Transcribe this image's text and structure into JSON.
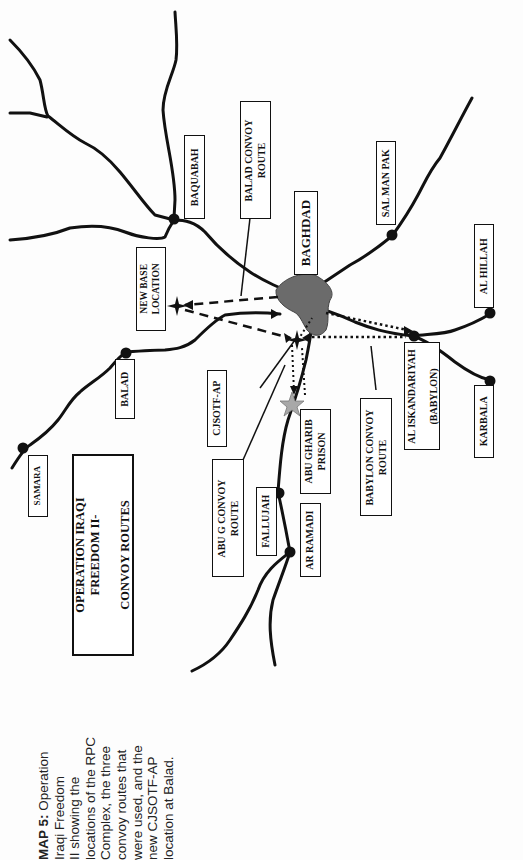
{
  "title_box": {
    "lines": "OPERATION IRAQI\nFREEDOM II-\n\nCONVOY ROUTES"
  },
  "caption": {
    "bold": "MAP 5:",
    "lines": [
      " Operation",
      "Iraqi Freedom",
      "II showing the",
      "locations of the RPC",
      "Complex, the three",
      "convoy routes that",
      "were used, and the",
      "new CJSOTF-AP",
      "location at Balad."
    ]
  },
  "places": {
    "baghdad": "BAGHDAD",
    "baquabah": "BAQUABAH",
    "balad": "BALAD",
    "samara": "SAMARA",
    "sal_man_pak": "SAL MAN PAK",
    "al_hillah": "AL HILLAH",
    "al_iskandariyah": "AL ISKANDARIYAH\n\n(BABYLON)",
    "karbala": "KARBALA",
    "fallujah": "FALLUJAH",
    "ar_ramadi": "AR RAMADI",
    "abu_ghraib": "ABU GHARIB\nPRISON",
    "new_base": "NEW BASE\nLOCATION",
    "cjsotf": "CJSOTF-AP"
  },
  "routes": {
    "balad": "BALAD CONVOY\nROUTE",
    "abu_g": "ABU G CONVOY\nROUTE",
    "babylon": "BABYLON CONVOY\nROUTE"
  },
  "legend_colors": {
    "city_fill": "#6b6b6b",
    "star_prison": "#a8a8a8",
    "road": "#111111"
  }
}
